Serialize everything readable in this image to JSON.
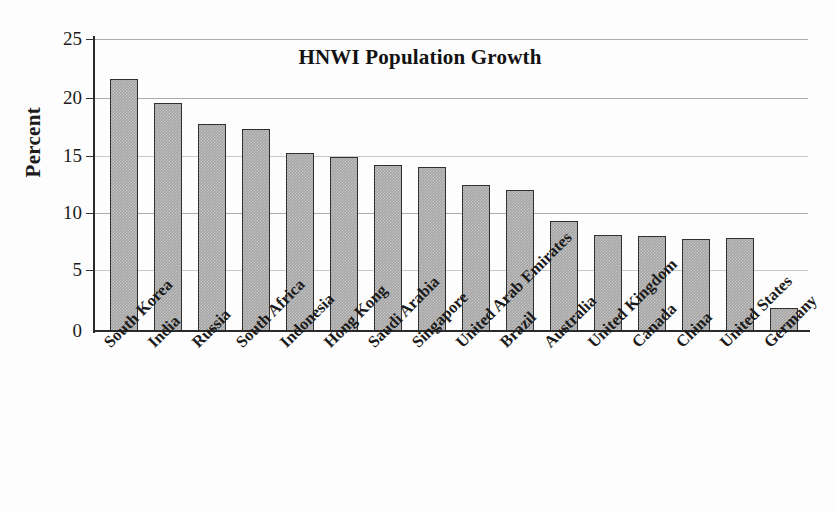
{
  "chart_data": {
    "type": "bar",
    "title": "HNWI Population Growth",
    "xlabel": "",
    "ylabel": "Percent",
    "ylim": [
      0,
      25
    ],
    "yticks": [
      0,
      5,
      10,
      15,
      20,
      25
    ],
    "grid": true,
    "legend": "none",
    "orientation": "vertical",
    "bar_color": "#a5a5a5",
    "bar_edge_color": "#303030",
    "categories": [
      "South Korea",
      "India",
      "Russia",
      "South Africa",
      "Indonesia",
      "Hong Kong",
      "Saudi Arabia",
      "Singapore",
      "United Arab Emirates",
      "Brazil",
      "Australia",
      "United Kingdom",
      "Canada",
      "China",
      "United States",
      "Germany"
    ],
    "values": [
      21.6,
      19.5,
      17.7,
      17.3,
      15.2,
      14.9,
      14.2,
      14.0,
      12.5,
      12.1,
      9.4,
      8.2,
      8.1,
      7.9,
      8.0,
      2.0
    ]
  },
  "axis": {
    "y_tick_labels": [
      "25",
      "20",
      "15",
      "10",
      "5",
      "0"
    ],
    "y_title": "Percent"
  }
}
